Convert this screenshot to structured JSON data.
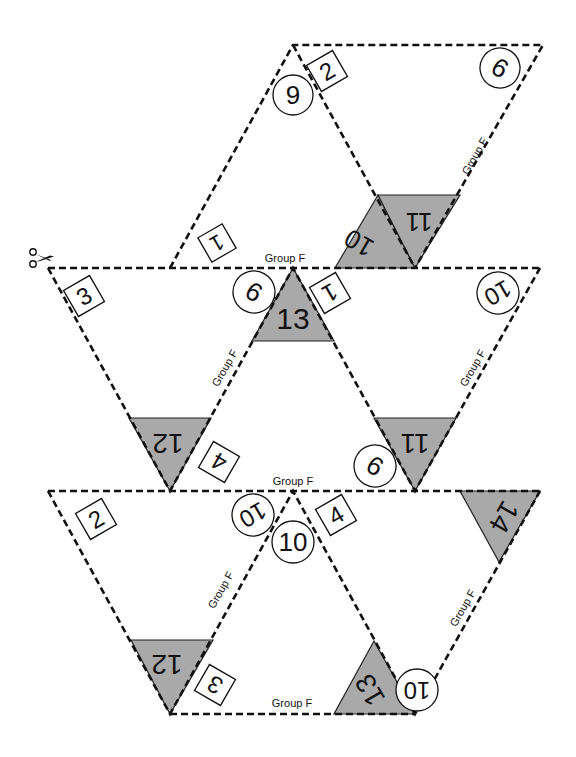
{
  "group_label": "Group F",
  "scissors_icon": "scissors-icon",
  "colors": {
    "shade": "#a9a9a9",
    "line": "#111111",
    "background": "#ffffff"
  },
  "top_piece": {
    "box_labels": [
      "1",
      "2"
    ],
    "circle_labels": [
      "9",
      "9"
    ],
    "shaded_labels": [
      "10",
      "11"
    ],
    "group_labels": [
      "Group F",
      "Group F"
    ]
  },
  "middle_row": {
    "box_labels": [
      "3",
      "4",
      "1"
    ],
    "circle_labels": [
      "9",
      "10",
      "9"
    ],
    "shaded_labels": [
      "13",
      "12",
      "11"
    ],
    "group_labels": [
      "Group F",
      "Group F",
      "Group F"
    ]
  },
  "bottom_row": {
    "box_labels": [
      "2",
      "3",
      "4"
    ],
    "circle_labels": [
      "10",
      "10",
      "10"
    ],
    "shaded_labels": [
      "12",
      "14",
      "13"
    ],
    "group_labels": [
      "Group F",
      "Group F",
      "Group F"
    ]
  }
}
